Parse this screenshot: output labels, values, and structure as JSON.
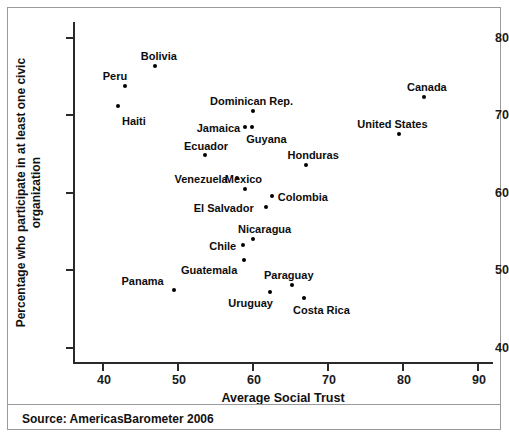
{
  "figure": {
    "source_note": "Source: AmericasBarometer 2006"
  },
  "chart_data": {
    "type": "scatter",
    "title": "",
    "xlabel": "Average Social Trust",
    "ylabel": "Percentage who participate in at least one civic organization",
    "ylabel_lines": [
      "Percentage who participate in at least one civic",
      "organization"
    ],
    "xlim": [
      36,
      92
    ],
    "ylim": [
      38,
      82
    ],
    "xticks": [
      40,
      50,
      60,
      70,
      80,
      90
    ],
    "yticks": [
      40,
      50,
      60,
      70,
      80
    ],
    "xtick_labels": [
      "40",
      "50",
      "60",
      "70",
      "80",
      "90"
    ],
    "ytick_labels": [
      "40",
      "50",
      "60",
      "70",
      "80"
    ],
    "grid": false,
    "legend": "none",
    "marker_color": "#000000",
    "points": [
      {
        "label": "Haiti",
        "x": 42.0,
        "y": 71.2,
        "label_dx": 4,
        "label_dy": 10
      },
      {
        "label": "Peru",
        "x": 42.9,
        "y": 73.8,
        "label_dx": -22,
        "label_dy": -15
      },
      {
        "label": "Bolivia",
        "x": 46.9,
        "y": 76.3,
        "label_dx": -14,
        "label_dy": -15
      },
      {
        "label": "Panama",
        "x": 49.4,
        "y": 47.4,
        "label_dx": -52,
        "label_dy": -14
      },
      {
        "label": "Ecuador",
        "x": 53.6,
        "y": 64.9,
        "label_dx": -21,
        "label_dy": -14
      },
      {
        "label": "Venezuela",
        "x": 57.8,
        "y": 61.9,
        "label_dx": -62,
        "label_dy": -4
      },
      {
        "label": "Chile",
        "x": 58.7,
        "y": 53.2,
        "label_dx": -34,
        "label_dy": -4
      },
      {
        "label": "Guatemala",
        "x": 58.8,
        "y": 51.3,
        "label_dx": -63,
        "label_dy": 5
      },
      {
        "label": "Jamaica",
        "x": 58.9,
        "y": 68.4,
        "label_dx": -48,
        "label_dy": -4
      },
      {
        "label": "Mexico",
        "x": 58.9,
        "y": 60.4,
        "label_dx": -20,
        "label_dy": -15
      },
      {
        "label": "Dominican Rep.",
        "x": 60.0,
        "y": 70.5,
        "label_dx": -43,
        "label_dy": -15
      },
      {
        "label": "Guyana",
        "x": 59.9,
        "y": 68.4,
        "label_dx": -6,
        "label_dy": 7
      },
      {
        "label": "Nicaragua",
        "x": 60.0,
        "y": 54.0,
        "label_dx": -15,
        "label_dy": -15
      },
      {
        "label": "El Salvador",
        "x": 61.7,
        "y": 58.1,
        "label_dx": -72,
        "label_dy": -4
      },
      {
        "label": "Colombia",
        "x": 62.5,
        "y": 59.5,
        "label_dx": 6,
        "label_dy": -4
      },
      {
        "label": "Uruguay",
        "x": 62.3,
        "y": 47.1,
        "label_dx": -42,
        "label_dy": 6
      },
      {
        "label": "Paraguay",
        "x": 65.2,
        "y": 48.1,
        "label_dx": -28,
        "label_dy": -15
      },
      {
        "label": "Costa Rica",
        "x": 66.8,
        "y": 46.4,
        "label_dx": -11,
        "label_dy": 7
      },
      {
        "label": "Honduras",
        "x": 67.0,
        "y": 63.6,
        "label_dx": -18,
        "label_dy": -15
      },
      {
        "label": "United States",
        "x": 79.5,
        "y": 67.5,
        "label_dx": -42,
        "label_dy": -15
      },
      {
        "label": "Canada",
        "x": 82.8,
        "y": 72.3,
        "label_dx": -17,
        "label_dy": -15
      }
    ]
  }
}
